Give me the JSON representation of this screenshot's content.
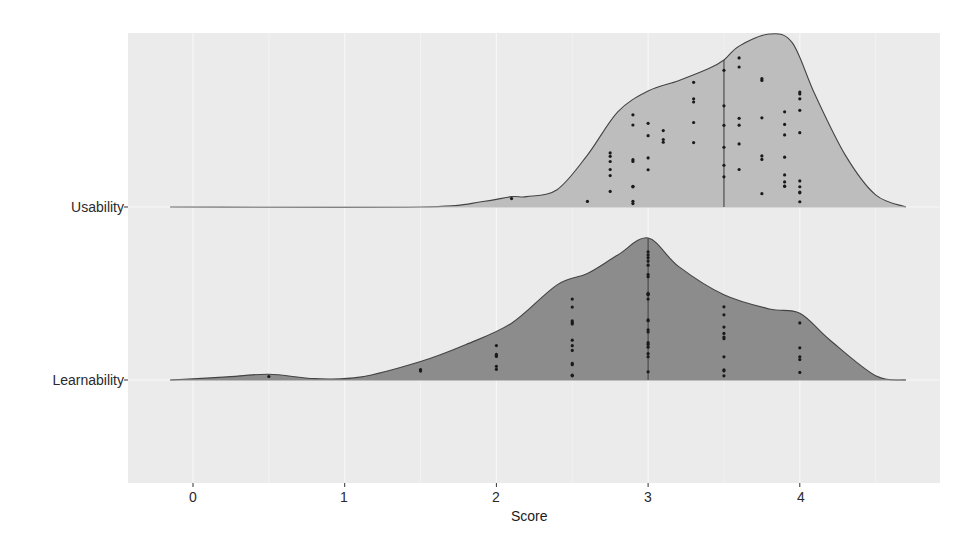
{
  "chart_data": {
    "type": "ridgeline",
    "title": "",
    "xlabel": "Score",
    "ylabel": "",
    "xlim": [
      -0.2,
      4.9
    ],
    "x_ticks": [
      0,
      1,
      2,
      3,
      4
    ],
    "x_tick_labels": [
      "0",
      "1",
      "2",
      "3",
      "4"
    ],
    "categories": [
      "Usability",
      "Learnability"
    ],
    "grid": true,
    "legend": "none",
    "series": [
      {
        "name": "Usability",
        "fill": "#bdbdbd",
        "median_line": 3.5,
        "density_x": [
          -0.15,
          1.5,
          1.9,
          2.1,
          2.2,
          2.4,
          2.6,
          2.8,
          3.0,
          3.2,
          3.4,
          3.5,
          3.6,
          3.8,
          3.95,
          4.1,
          4.3,
          4.5,
          4.7
        ],
        "density_y": [
          0.0,
          0.0,
          0.03,
          0.06,
          0.06,
          0.1,
          0.3,
          0.55,
          0.67,
          0.73,
          0.8,
          0.85,
          0.93,
          1.0,
          0.95,
          0.65,
          0.3,
          0.07,
          0.0
        ],
        "points": [
          2.1,
          2.6,
          2.75,
          2.75,
          2.75,
          2.75,
          2.75,
          2.75,
          2.9,
          2.9,
          2.9,
          2.9,
          2.9,
          2.9,
          2.9,
          2.9,
          3.0,
          3.0,
          3.0,
          3.0,
          3.1,
          3.1,
          3.1,
          3.3,
          3.3,
          3.3,
          3.3,
          3.3,
          3.5,
          3.5,
          3.5,
          3.5,
          3.5,
          3.5,
          3.6,
          3.6,
          3.6,
          3.6,
          3.6,
          3.6,
          3.75,
          3.75,
          3.75,
          3.75,
          3.75,
          3.75,
          3.9,
          3.9,
          3.9,
          3.9,
          3.9,
          3.9,
          3.9,
          3.9,
          4.0,
          4.0,
          4.0,
          4.0,
          4.0,
          4.0,
          4.0,
          4.0,
          4.0,
          4.0
        ]
      },
      {
        "name": "Learnability",
        "fill": "#8c8c8c",
        "median_line": 3.0,
        "density_x": [
          -0.15,
          0.2,
          0.5,
          0.8,
          1.1,
          1.5,
          1.8,
          2.1,
          2.4,
          2.6,
          2.8,
          3.0,
          3.2,
          3.5,
          3.8,
          4.0,
          4.2,
          4.5,
          4.7
        ],
        "density_y": [
          0.0,
          0.02,
          0.04,
          0.01,
          0.02,
          0.13,
          0.25,
          0.4,
          0.67,
          0.75,
          0.88,
          1.0,
          0.8,
          0.6,
          0.5,
          0.47,
          0.28,
          0.03,
          0.0
        ],
        "points": [
          0.5,
          1.5,
          1.5,
          2.0,
          2.0,
          2.0,
          2.0,
          2.0,
          2.0,
          2.5,
          2.5,
          2.5,
          2.5,
          2.5,
          2.5,
          2.5,
          2.5,
          2.5,
          2.5,
          2.5,
          2.5,
          3.0,
          3.0,
          3.0,
          3.0,
          3.0,
          3.0,
          3.0,
          3.0,
          3.0,
          3.0,
          3.0,
          3.0,
          3.0,
          3.0,
          3.0,
          3.0,
          3.0,
          3.0,
          3.0,
          3.0,
          3.0,
          3.5,
          3.5,
          3.5,
          3.5,
          3.5,
          3.5,
          3.5,
          3.5,
          3.5,
          3.5,
          4.0,
          4.0,
          4.0,
          4.0,
          4.0
        ]
      }
    ]
  },
  "axes": {
    "x_title": "Score",
    "y_labels": [
      "Usability",
      "Learnability"
    ],
    "x_tick_labels": [
      "0",
      "1",
      "2",
      "3",
      "4"
    ]
  },
  "colors": {
    "panel_bg": "#ebebeb",
    "grid": "#f7f7f7",
    "usability_fill": "#bdbdbd",
    "learnability_fill": "#8c8c8c",
    "outline": "#444444",
    "points": "#1a1a1a"
  }
}
